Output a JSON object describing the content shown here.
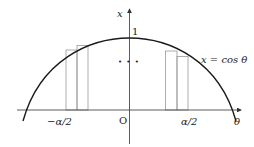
{
  "diagram": {
    "curve_label": "x = cos θ",
    "curve_label_parts": {
      "lhs": "x",
      "eq": "=",
      "fn": "cos",
      "var": "θ"
    },
    "y_axis_label": "x",
    "x_axis_label": "θ",
    "origin_label": "O",
    "peak_label": "1",
    "left_tick_label": "−α/2",
    "right_tick_label": "α/2",
    "ellipsis": "• • •",
    "colors": {
      "curve": "#1a1a1a",
      "axes": "#333333",
      "rectangles": "#9a9a9a"
    }
  }
}
